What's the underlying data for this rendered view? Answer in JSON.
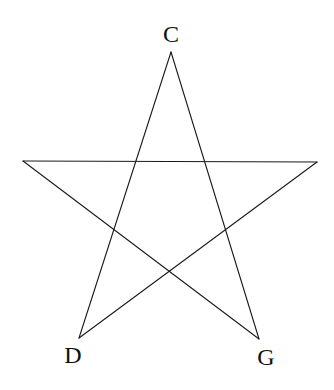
{
  "diagram": {
    "type": "pentagram",
    "stroke_color": "#1a1a1a",
    "background": "#ffffff",
    "vertices": {
      "top": {
        "label": "C",
        "x": 171,
        "y": 52
      },
      "left": {
        "label": "",
        "x": 23,
        "y": 161
      },
      "right": {
        "label": "",
        "x": 317,
        "y": 162
      },
      "bottom_left": {
        "label": "D",
        "x": 79,
        "y": 338
      },
      "bottom_right": {
        "label": "G",
        "x": 259,
        "y": 339
      }
    },
    "labels": [
      {
        "id": "C",
        "text": "C",
        "x": 171,
        "y": 42
      },
      {
        "id": "D",
        "text": "D",
        "x": 73,
        "y": 363
      },
      {
        "id": "G",
        "text": "G",
        "x": 266,
        "y": 365
      }
    ],
    "segments": [
      {
        "from": "top",
        "to": "bottom_left"
      },
      {
        "from": "top",
        "to": "bottom_right"
      },
      {
        "from": "left",
        "to": "right"
      },
      {
        "from": "left",
        "to": "bottom_right"
      },
      {
        "from": "right",
        "to": "bottom_left"
      }
    ]
  }
}
